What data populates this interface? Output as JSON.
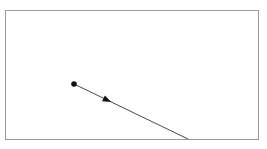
{
  "canvas": {
    "width": 267,
    "height": 149,
    "background_color": "#ffffff"
  },
  "frame": {
    "label": "diagram border rectangle",
    "x": 5,
    "y": 10,
    "width": 253,
    "height": 129,
    "stroke_color": "#9a9a9a",
    "stroke_width": 1,
    "fill_color": "#ffffff"
  },
  "vector": {
    "label": "directed line segment",
    "start_x": 74,
    "start_y": 84,
    "end_x": 188,
    "end_y": 139,
    "stroke_color": "#4a4a4a",
    "stroke_width": 1
  },
  "start_point": {
    "label": "origin dot",
    "cx": 74,
    "cy": 84,
    "r": 2.8,
    "fill_color": "#111111"
  },
  "arrowhead": {
    "label": "direction arrowhead",
    "cx": 107,
    "cy": 100,
    "size": 4.6,
    "angle_deg": 25.8,
    "fill_color": "#111111"
  }
}
